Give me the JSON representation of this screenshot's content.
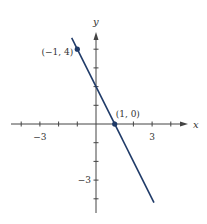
{
  "chart_data": {
    "type": "line",
    "title": "",
    "xlabel": "x",
    "ylabel": "y",
    "xlim": [
      -5,
      5
    ],
    "ylim": [
      -5,
      5
    ],
    "grid": false,
    "x_tick_labels": [
      {
        "value": -3,
        "label": "-3"
      },
      {
        "value": 3,
        "label": "3"
      }
    ],
    "y_tick_labels": [
      {
        "value": -3,
        "label": "-3"
      }
    ],
    "series": [
      {
        "name": "y = -2x + 2",
        "color": "#1f3a68",
        "x": [
          -1.3,
          3.1
        ],
        "y": [
          4.6,
          -4.2
        ]
      }
    ],
    "points": [
      {
        "x": -1,
        "y": 4,
        "label": "(−1, 4)"
      },
      {
        "x": 1,
        "y": 0,
        "label": "(1, 0)"
      }
    ]
  },
  "colors": {
    "axis": "#444444",
    "line": "#1f3a68",
    "text": "#333333"
  }
}
